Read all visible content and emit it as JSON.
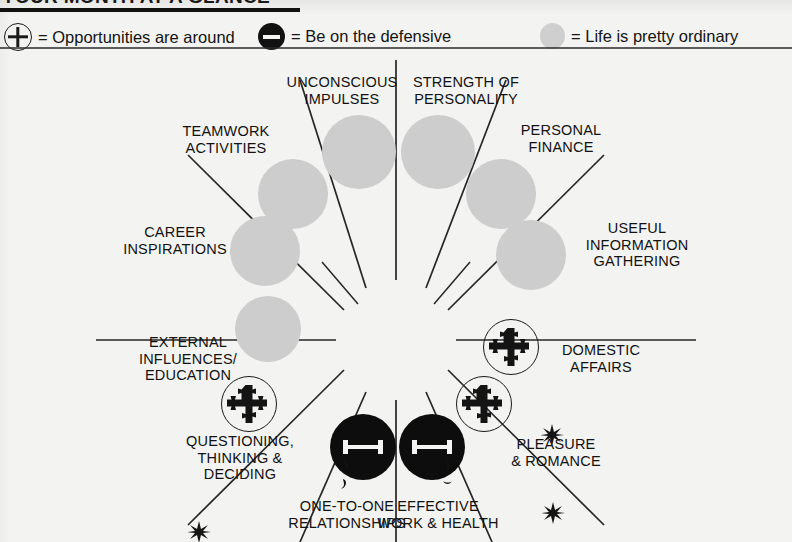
{
  "title": {
    "text": "YOUR MONTH AT A GLANCE"
  },
  "legend": {
    "items": [
      {
        "icon": "plus-circle-icon",
        "symbol": "+",
        "label": "= Opportunities are around"
      },
      {
        "icon": "minus-circle-icon",
        "symbol": "−",
        "label": "= Be on the defensive"
      },
      {
        "icon": "gray-circle-icon",
        "symbol": "",
        "label": "= Life is pretty ordinary"
      }
    ]
  },
  "wheel": {
    "sectors": [
      {
        "id": "unconscious-impulses",
        "label": "UNCONSCIOUS\nIMPULSES",
        "marker": "neutral"
      },
      {
        "id": "strength-of-personality",
        "label": "STRENGTH OF\nPERSONALITY",
        "marker": "neutral"
      },
      {
        "id": "personal-finance",
        "label": "PERSONAL\nFINANCE",
        "marker": "neutral"
      },
      {
        "id": "useful-information-gathering",
        "label": "USEFUL\nINFORMATION\nGATHERING",
        "marker": "neutral"
      },
      {
        "id": "domestic-affairs",
        "label": "DOMESTIC\nAFFAIRS",
        "marker": "plus"
      },
      {
        "id": "pleasure-and-romance",
        "label": "PLEASURE\n& ROMANCE",
        "marker": "plus"
      },
      {
        "id": "effective-work-and-health",
        "label": "EFFECTIVE\nWORK & HEALTH",
        "marker": "minus"
      },
      {
        "id": "one-to-one-relationships",
        "label": "ONE-TO-ONE\nRELATIONSHIPS",
        "marker": "minus"
      },
      {
        "id": "questioning-thinking-deciding",
        "label": "QUESTIONING,\nTHINKING &\nDECIDING",
        "marker": "plus"
      },
      {
        "id": "external-influences-education",
        "label": "EXTERNAL\nINFLUENCES/\nEDUCATION",
        "marker": "neutral"
      },
      {
        "id": "career-inspirations",
        "label": "CAREER\nINSPIRATIONS",
        "marker": "neutral"
      },
      {
        "id": "teamwork-activities",
        "label": "TEAMWORK\nACTIVITIES",
        "marker": "neutral"
      }
    ]
  },
  "colors": {
    "ink": "#121212",
    "gray_marker": "#cdcdcd",
    "black_marker": "#0d0d0d",
    "page": "#f3f3f1"
  }
}
